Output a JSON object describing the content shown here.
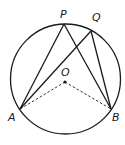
{
  "diagram": {
    "labels": {
      "P": "P",
      "Q": "Q",
      "O": "O",
      "A": "A",
      "B": "B"
    },
    "points": [
      "P",
      "Q",
      "O",
      "A",
      "B"
    ],
    "segments": [
      {
        "from": "A",
        "to": "P",
        "style": "solid"
      },
      {
        "from": "P",
        "to": "B",
        "style": "solid"
      },
      {
        "from": "A",
        "to": "Q",
        "style": "solid"
      },
      {
        "from": "Q",
        "to": "B",
        "style": "solid"
      },
      {
        "from": "O",
        "to": "A",
        "style": "dashed"
      },
      {
        "from": "O",
        "to": "B",
        "style": "dashed"
      }
    ],
    "colors": {
      "stroke": "#1a1a1a",
      "background": "#ffffff"
    }
  }
}
